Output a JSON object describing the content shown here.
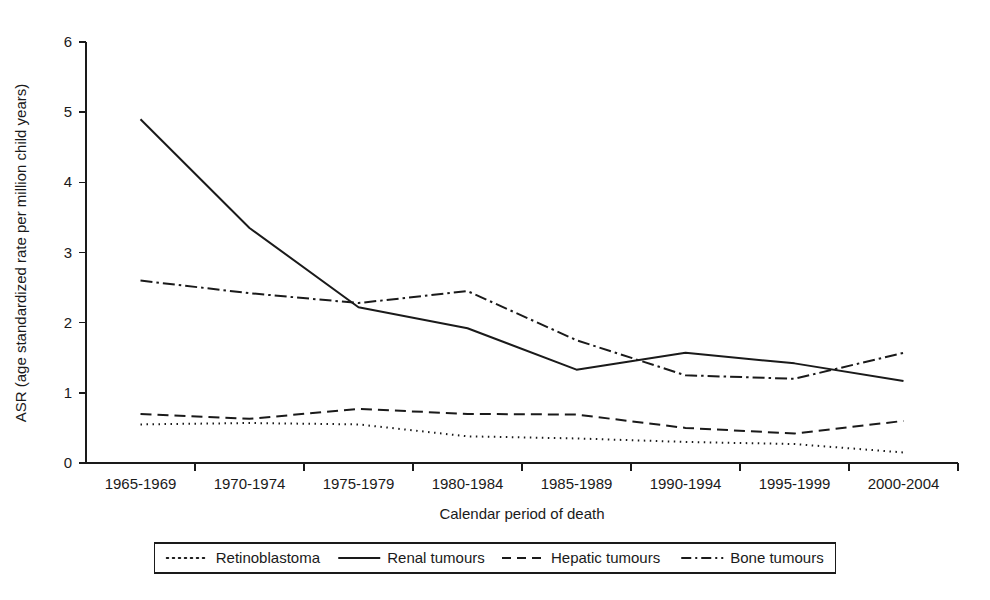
{
  "chart_data": {
    "type": "line",
    "title": "",
    "xlabel": "Calendar period of death",
    "ylabel": "ASR (age standardized rate per million child years)",
    "categories": [
      "1965-1969",
      "1970-1974",
      "1975-1979",
      "1980-1984",
      "1985-1989",
      "1990-1994",
      "1995-1999",
      "2000-2004"
    ],
    "ylim": [
      0,
      6
    ],
    "yticks": [
      0,
      1,
      2,
      3,
      4,
      5,
      6
    ],
    "ytick_labels": [
      "0",
      "1",
      "2",
      "3",
      "4",
      "5",
      "6"
    ],
    "grid": false,
    "legend_position": "bottom",
    "series": [
      {
        "name": "Retinoblastoma",
        "dash": "dotted",
        "dasharray": "1.5,4.5",
        "legend_swatch_dasharray": "1.5,4.5",
        "values": [
          0.55,
          0.57,
          0.55,
          0.38,
          0.35,
          0.3,
          0.27,
          0.15
        ]
      },
      {
        "name": "Renal tumours",
        "dash": "solid",
        "dasharray": "none",
        "legend_swatch_dasharray": "none",
        "values": [
          4.9,
          3.35,
          2.22,
          1.92,
          1.33,
          1.57,
          1.42,
          1.17
        ]
      },
      {
        "name": "Hepatic tumours",
        "dash": "dashed",
        "dasharray": "11,6",
        "legend_swatch_dasharray": "9,6",
        "values": [
          0.7,
          0.63,
          0.77,
          0.7,
          0.69,
          0.5,
          0.42,
          0.6
        ]
      },
      {
        "name": "Bone tumours",
        "dash": "dashdot",
        "dasharray": "12,4,2.5,4",
        "legend_swatch_dasharray": "10,4,2,4",
        "values": [
          2.6,
          2.42,
          2.28,
          2.45,
          1.75,
          1.25,
          1.2,
          1.57
        ]
      }
    ],
    "colors": {
      "axis": "#1a1a1a",
      "series": "#1a1a1a",
      "background": "#ffffff"
    }
  }
}
